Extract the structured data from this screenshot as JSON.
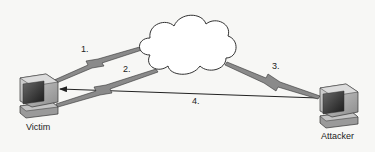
{
  "diagram": {
    "type": "network-attack-flow",
    "nodes": [
      {
        "id": "victim",
        "label": "Victim",
        "icon": "desktop-computer-icon"
      },
      {
        "id": "internet",
        "label": "",
        "icon": "cloud-icon"
      },
      {
        "id": "attacker",
        "label": "Attacker",
        "icon": "desktop-computer-icon"
      }
    ],
    "edges": [
      {
        "id": "e1",
        "label": "1.",
        "from": "victim",
        "to": "internet",
        "style": "lightning-bolt"
      },
      {
        "id": "e2",
        "label": "2.",
        "from": "internet",
        "to": "victim",
        "style": "lightning-bolt"
      },
      {
        "id": "e3",
        "label": "3.",
        "from": "internet",
        "to": "attacker",
        "style": "lightning-bolt"
      },
      {
        "id": "e4",
        "label": "4.",
        "from": "attacker",
        "to": "victim",
        "style": "arrow"
      }
    ]
  },
  "labels": {
    "victim": "Victim",
    "attacker": "Attacker",
    "step1": "1.",
    "step2": "2.",
    "step3": "3.",
    "step4": "4."
  },
  "colors": {
    "background": "#f7f7f5",
    "stroke": "#333333",
    "bolt_fill": "#8a8a8a",
    "screen": "#2a2a2a",
    "monitor": "#b8b8b8"
  }
}
